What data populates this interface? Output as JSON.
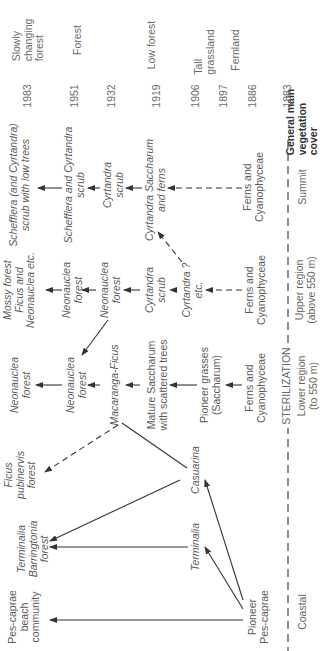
{
  "diagram": {
    "orientation": "rotated -90deg (reads bottom-to-top)",
    "regions": {
      "coastal": "Coastal",
      "lower": "Lower region\n(to 550 m)",
      "sterilization": "STERILIZATION",
      "upper": "Upper region\n(above 550 m)",
      "summit": "Summit"
    },
    "years": [
      "1983",
      "1951",
      "1932",
      "1919",
      "1906",
      "1897",
      "1886",
      "1883"
    ],
    "vegetation_cover_header": "General main\nvegetation\ncover",
    "vegetation_cover": [
      {
        "year": "1983",
        "label": "Slowly\nchanging\nforest"
      },
      {
        "year": "1951",
        "label": "Forest"
      },
      {
        "year": "1919",
        "label": "Low forest"
      },
      {
        "year": "1906",
        "label": "Tall\ngrassland"
      },
      {
        "year": "1897",
        "label": "Fernland"
      }
    ],
    "nodes": {
      "pes_beach": "Pes-caprae\nbeach\ncommunity",
      "terminalia_barringtonia": "Terminalia\nBarringtonia\nforest",
      "ficus_pubinervis": "Ficus\npubinervis\nforest",
      "pioneer_pes": "Pioneer\nPes-caprae",
      "terminalia": "Terminalia",
      "casuarina": "Casuarina",
      "neonauclea_forest_1": "Neonauclea\nforest",
      "neonauclea_forest_2": "Neonauclea\nforest",
      "macaranga_ficus": "Macaranga-Ficus",
      "mature_saccharum": "Mature Saccharum\nwith scattered trees",
      "pioneer_grasses": "Pioneer grasses\n(Saccharum)",
      "ferns_lower": "Ferns and\nCyanophyceae",
      "mossy_forest": "Mossy forest\nFicus and\nNeonauclea etc.",
      "neonauclea_upper_1": "Neonauclea\nforest",
      "neonauclea_upper_2": "Neonauclea\nforest",
      "cyrtandra_scrub_upper": "Cyrtandra\nscrub",
      "cyrtandra_q": "Cyrtandra ?\netc.",
      "ferns_upper": "Ferns and\nCyanophyceae",
      "schefflera_low_trees": "Schefflera (and Cyrtandra)\nscrub with low trees",
      "schefflera_cyrtandra": "Schefflera and Cyrtandra\nscrub",
      "cyrtandra_scrub_summit": "Cyrtandra\nscrub",
      "cyrtandra_saccharum_ferns": "Cyrtandra Saccharum\nand ferns",
      "ferns_summit": "Ferns and\nCyanophyceae"
    },
    "line_color": "#333333",
    "text_color": "#5a5a5a"
  }
}
